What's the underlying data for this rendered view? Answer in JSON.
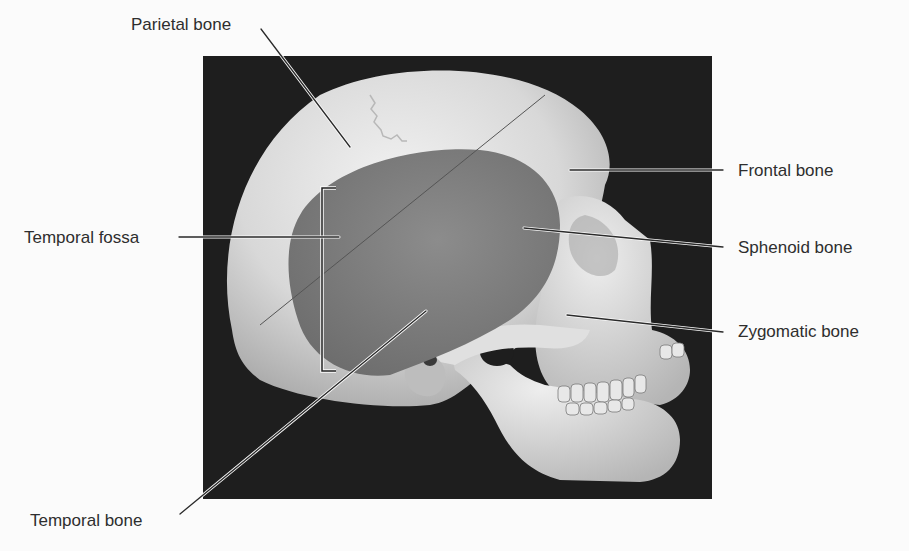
{
  "figure": {
    "background_color": "#fbfbfb",
    "photo_background_color": "#1e1e1e",
    "bone_color": "#d9d9d9",
    "fossa_shade_color": "#7d7d7d",
    "leader_line_color": "#2a2a2a"
  },
  "labels": {
    "parietal_bone": "Parietal bone",
    "temporal_fossa": "Temporal fossa",
    "temporal_bone": "Temporal bone",
    "frontal_bone": "Frontal bone",
    "sphenoid_bone": "Sphenoid bone",
    "zygomatic_bone": "Zygomatic bone"
  }
}
